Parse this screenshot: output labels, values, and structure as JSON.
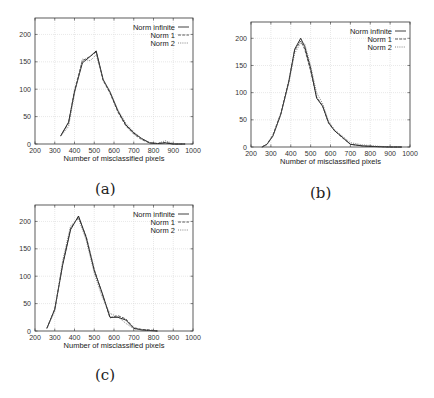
{
  "figure": {
    "captions": [
      "(a)",
      "(b)",
      "(c)"
    ]
  },
  "chart_data": [
    {
      "id": "a",
      "type": "line",
      "caption": "(a)",
      "title": "",
      "xlabel": "Number of misclassified pixels",
      "ylabel": "",
      "xlim": [
        200,
        1000
      ],
      "ylim": [
        0,
        230
      ],
      "xticks": [
        200,
        300,
        400,
        500,
        600,
        700,
        800,
        900,
        1000
      ],
      "yticks": [
        0,
        50,
        100,
        150,
        200
      ],
      "grid": true,
      "legend_position": "top-right",
      "series": [
        {
          "name": "Norm infinite",
          "style": "solid",
          "x": [
            330,
            370,
            400,
            440,
            480,
            510,
            545,
            580,
            620,
            660,
            700,
            740,
            780,
            820,
            860,
            900,
            960
          ],
          "y": [
            15,
            40,
            95,
            148,
            160,
            170,
            118,
            95,
            60,
            35,
            20,
            10,
            2,
            1,
            2,
            0,
            0
          ]
        },
        {
          "name": "Norm 1",
          "style": "dashed",
          "x": [
            330,
            370,
            400,
            440,
            480,
            510,
            545,
            580,
            620,
            660,
            700,
            740,
            780,
            820,
            860,
            900,
            960
          ],
          "y": [
            15,
            38,
            98,
            152,
            160,
            168,
            116,
            93,
            58,
            33,
            18,
            8,
            2,
            1,
            3,
            0,
            0
          ]
        },
        {
          "name": "Norm 2",
          "style": "dotted",
          "x": [
            330,
            370,
            400,
            440,
            480,
            510,
            545,
            580,
            620,
            660,
            700,
            740,
            780,
            820,
            860,
            900,
            960
          ],
          "y": [
            14,
            32,
            92,
            155,
            152,
            163,
            118,
            96,
            62,
            38,
            22,
            10,
            3,
            1,
            6,
            1,
            0
          ]
        }
      ]
    },
    {
      "id": "b",
      "type": "line",
      "caption": "(b)",
      "title": "",
      "xlabel": "Number of misclassified pixels",
      "ylabel": "",
      "xlim": [
        200,
        1000
      ],
      "ylim": [
        0,
        230
      ],
      "xticks": [
        200,
        300,
        400,
        500,
        600,
        700,
        800,
        900,
        1000
      ],
      "yticks": [
        0,
        50,
        100,
        150,
        200
      ],
      "grid": true,
      "legend_position": "top-right",
      "series": [
        {
          "name": "Norm infinite",
          "style": "solid",
          "x": [
            255,
            280,
            310,
            350,
            390,
            420,
            450,
            470,
            500,
            530,
            560,
            590,
            620,
            660,
            700,
            760,
            820,
            900,
            960
          ],
          "y": [
            0,
            5,
            20,
            60,
            120,
            180,
            200,
            185,
            145,
            90,
            75,
            45,
            30,
            18,
            5,
            2,
            1,
            0,
            0
          ]
        },
        {
          "name": "Norm 1",
          "style": "dashed",
          "x": [
            255,
            280,
            310,
            350,
            390,
            420,
            450,
            470,
            500,
            530,
            560,
            590,
            620,
            660,
            700,
            760,
            820,
            900,
            960
          ],
          "y": [
            0,
            5,
            22,
            62,
            122,
            178,
            195,
            180,
            140,
            92,
            76,
            44,
            30,
            17,
            5,
            2,
            1,
            0,
            0
          ]
        },
        {
          "name": "Norm 2",
          "style": "dotted",
          "x": [
            255,
            280,
            310,
            350,
            390,
            420,
            450,
            470,
            500,
            530,
            560,
            590,
            620,
            660,
            700,
            760,
            820,
            900,
            960
          ],
          "y": [
            0,
            4,
            20,
            60,
            118,
            172,
            192,
            190,
            150,
            100,
            80,
            48,
            32,
            20,
            8,
            4,
            2,
            0,
            0
          ]
        }
      ]
    },
    {
      "id": "c",
      "type": "line",
      "caption": "(c)",
      "title": "",
      "xlabel": "Number of misclassified pixels",
      "ylabel": "",
      "xlim": [
        200,
        1000
      ],
      "ylim": [
        0,
        230
      ],
      "xticks": [
        200,
        300,
        400,
        500,
        600,
        700,
        800,
        900,
        1000
      ],
      "yticks": [
        0,
        50,
        100,
        150,
        200
      ],
      "grid": true,
      "legend_position": "top-right",
      "series": [
        {
          "name": "Norm infinite",
          "style": "solid",
          "x": [
            260,
            300,
            340,
            380,
            420,
            460,
            500,
            540,
            580,
            620,
            660,
            700,
            740,
            780,
            820
          ],
          "y": [
            5,
            40,
            120,
            185,
            210,
            170,
            110,
            70,
            25,
            25,
            20,
            5,
            2,
            1,
            0
          ]
        },
        {
          "name": "Norm 1",
          "style": "dashed",
          "x": [
            260,
            300,
            340,
            380,
            420,
            460,
            500,
            540,
            580,
            620,
            660,
            700,
            740,
            780,
            820
          ],
          "y": [
            5,
            40,
            122,
            188,
            208,
            172,
            112,
            68,
            24,
            28,
            22,
            6,
            3,
            2,
            0
          ]
        },
        {
          "name": "Norm 2",
          "style": "dotted",
          "x": [
            260,
            300,
            340,
            380,
            420,
            460,
            500,
            540,
            580,
            620,
            660,
            700,
            740,
            780,
            820
          ],
          "y": [
            5,
            36,
            128,
            192,
            205,
            165,
            105,
            62,
            32,
            26,
            14,
            4,
            2,
            1,
            0
          ]
        }
      ]
    }
  ]
}
